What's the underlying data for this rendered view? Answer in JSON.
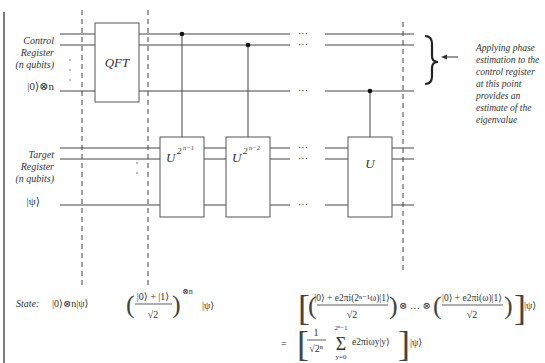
{
  "diagram": {
    "registers": {
      "control": {
        "label_lines": [
          "Control",
          "Register",
          "(n qubits)"
        ],
        "init_state": "|0⟩⊗n"
      },
      "target": {
        "label_lines": [
          "Target",
          "Register",
          "(n qubits)"
        ],
        "init_state": "|ψ⟩"
      }
    },
    "gates": {
      "qft": "QFT",
      "u1_base": "U",
      "u1_exp": "2",
      "u1_exp2": "n−1",
      "u2_base": "U",
      "u2_exp": "2",
      "u2_exp2": "n−2",
      "u3": "U"
    },
    "ellipsis": "···",
    "annotation": {
      "lines": [
        "Applying phase",
        "estimation to the",
        "control register",
        "at this point",
        "provides an",
        "estimate of the",
        "eigenvalue"
      ]
    },
    "states": {
      "label": "State:",
      "s1": "|0⟩⊗n|ψ⟩",
      "s2_num": "|0⟩ + |1⟩",
      "s2_den": "√2",
      "s2_pow": "⊗n",
      "s2_tail": "|ψ⟩",
      "s3_line1_a_num": "|0⟩ + e2πi(2ⁿ⁻¹ω)|1⟩",
      "s3_line1_den": "√2",
      "s3_line1_mid": "⊗ … ⊗",
      "s3_line1_b_num": "|0⟩ + e2πi(ω)|1⟩",
      "s3_line1_tail": "|ψ⟩",
      "s3_line2_eq": "=",
      "s3_line2_frac_num": "1",
      "s3_line2_frac_den": "√2ⁿ",
      "s3_line2_sum": "Σ",
      "s3_line2_sum_top": "2ⁿ−1",
      "s3_line2_sum_bot": "y=0",
      "s3_line2_term": "e2πiωy|y⟩",
      "s3_line2_tail": "|ψ⟩"
    }
  }
}
